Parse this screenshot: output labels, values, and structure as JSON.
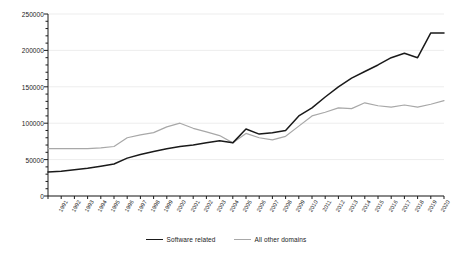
{
  "chart_data": {
    "type": "line",
    "title": "",
    "subtitle": "",
    "xlabel": "",
    "ylabel": "",
    "categories": [
      "1991",
      "1992",
      "1993",
      "1994",
      "1995",
      "1996",
      "1997",
      "1998",
      "1999",
      "2000",
      "2001",
      "2002",
      "2003",
      "2004",
      "2005",
      "2006",
      "2007",
      "2008",
      "2009",
      "2010",
      "2011",
      "2012",
      "2013",
      "2014",
      "2015",
      "2016",
      "2017",
      "2018",
      "2019",
      "2020",
      "2021"
    ],
    "series": [
      {
        "name": "Software related",
        "color": "#1a1a1a",
        "values": [
          33000,
          34000,
          36000,
          38000,
          41000,
          44000,
          52000,
          57000,
          61000,
          65000,
          68000,
          70000,
          73000,
          76000,
          73000,
          92000,
          85000,
          87000,
          90000,
          110000,
          121000,
          136000,
          150000,
          162000,
          171000,
          180000,
          190000,
          196000,
          190000,
          224000,
          224000
        ]
      },
      {
        "name": "All other domains",
        "color": "#a8a8a8",
        "values": [
          65000,
          65000,
          65000,
          65000,
          66000,
          68000,
          80000,
          84000,
          87000,
          95000,
          100000,
          93000,
          88000,
          83000,
          73000,
          86000,
          80000,
          77000,
          82000,
          96000,
          110000,
          115000,
          121000,
          120000,
          128000,
          124000,
          122000,
          125000,
          122000,
          126000,
          131000
        ]
      }
    ],
    "ylim": [
      0,
      250000
    ],
    "yticks": [
      0,
      50000,
      100000,
      150000,
      200000,
      250000
    ],
    "yticks_minor_step": 10000,
    "grid": true,
    "legend_position": "bottom"
  }
}
